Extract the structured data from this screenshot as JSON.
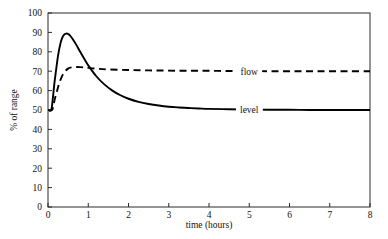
{
  "chart_data": {
    "type": "line",
    "title": "",
    "subtitle": "",
    "xlabel": "time (hours)",
    "ylabel": "% of range",
    "xlim": [
      0,
      8
    ],
    "ylim": [
      0,
      100
    ],
    "xticks": [
      "0",
      "1",
      "2",
      "3",
      "4",
      "5",
      "6",
      "7",
      "8"
    ],
    "yticks": [
      "0",
      "10",
      "20",
      "30",
      "40",
      "50",
      "60",
      "70",
      "80",
      "90",
      "100"
    ],
    "grid": false,
    "legend_position": "inline-right",
    "annotations": [
      {
        "text": "flow",
        "x": 5.0,
        "y": 70
      },
      {
        "text": "level",
        "x": 5.0,
        "y": 50
      }
    ],
    "series": [
      {
        "name": "level",
        "style": "solid",
        "color": "#000000",
        "x": [
          0.0,
          0.08,
          0.12,
          0.16,
          0.2,
          0.25,
          0.3,
          0.35,
          0.4,
          0.45,
          0.5,
          0.55,
          0.6,
          0.7,
          0.8,
          0.9,
          1.0,
          1.2,
          1.4,
          1.6,
          1.8,
          2.0,
          2.25,
          2.5,
          2.75,
          3.0,
          3.25,
          3.5,
          3.75,
          4.0,
          4.5,
          5.0,
          5.5,
          6.0,
          6.5,
          7.0,
          7.5,
          8.0
        ],
        "y": [
          50.0,
          50.0,
          56.0,
          64.0,
          70.5,
          78.0,
          83.5,
          87.0,
          88.8,
          89.4,
          89.2,
          88.3,
          87.0,
          83.7,
          80.0,
          76.4,
          73.0,
          67.4,
          63.2,
          60.0,
          57.6,
          55.8,
          54.2,
          53.1,
          52.3,
          51.7,
          51.3,
          51.0,
          50.8,
          50.6,
          50.4,
          50.2,
          50.1,
          50.1,
          50.0,
          50.0,
          50.0,
          50.0
        ]
      },
      {
        "name": "flow",
        "style": "dashed",
        "color": "#000000",
        "x": [
          0.0,
          0.1,
          0.14,
          0.18,
          0.22,
          0.26,
          0.3,
          0.35,
          0.4,
          0.45,
          0.5,
          0.55,
          0.6,
          0.7,
          0.8,
          0.9,
          1.0,
          1.2,
          1.5,
          2.0,
          2.5,
          3.0,
          3.5,
          4.0,
          4.5,
          5.0,
          5.5,
          6.0,
          6.5,
          7.0,
          7.5,
          8.0
        ],
        "y": [
          50.0,
          50.0,
          53.0,
          56.5,
          59.5,
          62.5,
          65.0,
          67.5,
          69.2,
          70.5,
          71.3,
          71.8,
          72.0,
          72.2,
          72.1,
          71.9,
          71.7,
          71.3,
          70.9,
          70.6,
          70.4,
          70.3,
          70.2,
          70.2,
          70.1,
          70.1,
          70.0,
          70.0,
          70.0,
          70.0,
          70.0,
          70.0
        ]
      }
    ]
  },
  "plot": {
    "left": 48,
    "right": 370,
    "top": 13,
    "bottom": 207
  },
  "labels": {
    "flow": "flow",
    "level": "level"
  }
}
